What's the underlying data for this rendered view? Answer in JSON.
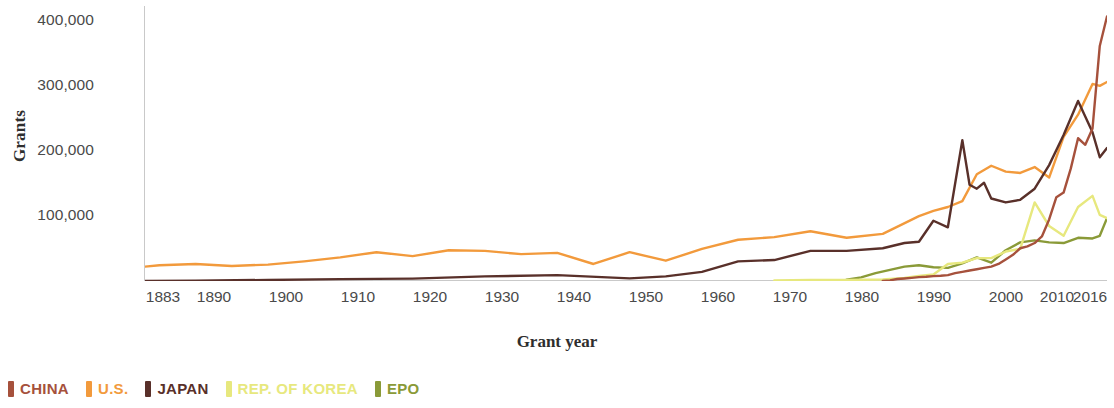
{
  "chart_data": {
    "type": "line",
    "title": "",
    "xlabel": "Grant year",
    "ylabel": "Grants",
    "xlim": [
      1883,
      2016
    ],
    "ylim": [
      0,
      420000
    ],
    "grid": false,
    "legend_position": "bottom-left",
    "ytick_labels": [
      "400,000",
      "300,000",
      "200,000",
      "100,000"
    ],
    "ytick_values": [
      400000,
      300000,
      200000,
      100000
    ],
    "xtick_labels": [
      "1883",
      "1890",
      "1900",
      "1910",
      "1920",
      "1930",
      "1940",
      "1950",
      "1960",
      "1970",
      "1980",
      "1990",
      "2000",
      "2010",
      "2016"
    ],
    "xtick_values": [
      1883,
      1890,
      1900,
      1910,
      1920,
      1930,
      1940,
      1950,
      1960,
      1970,
      1980,
      1990,
      2000,
      2010,
      2016
    ],
    "series": [
      {
        "name": "CHINA",
        "color": "#a6513c",
        "x": [
          1985,
          1986,
          1987,
          1988,
          1989,
          1990,
          1991,
          1992,
          1993,
          1994,
          1995,
          1996,
          1997,
          1998,
          1999,
          2000,
          2001,
          2002,
          2003,
          2004,
          2005,
          2006,
          2007,
          2008,
          2009,
          2010,
          2011,
          2012,
          2013,
          2014,
          2015,
          2016
        ],
        "values": [
          138,
          1020,
          3023,
          3900,
          4800,
          5900,
          6500,
          7500,
          8000,
          9000,
          12000,
          14000,
          16000,
          18000,
          20000,
          22000,
          26000,
          33000,
          40000,
          50000,
          53000,
          58000,
          68000,
          94000,
          128000,
          135000,
          172000,
          218000,
          208000,
          233000,
          359000,
          404000
        ]
      },
      {
        "name": "U.S.",
        "color": "#f29a3c",
        "x": [
          1883,
          1885,
          1890,
          1895,
          1900,
          1905,
          1910,
          1915,
          1920,
          1925,
          1930,
          1935,
          1940,
          1945,
          1950,
          1955,
          1960,
          1965,
          1970,
          1975,
          1980,
          1985,
          1990,
          1992,
          1994,
          1996,
          1998,
          2000,
          2002,
          2004,
          2006,
          2008,
          2010,
          2012,
          2014,
          2015,
          2016
        ],
        "values": [
          22000,
          24000,
          26000,
          23000,
          25000,
          30000,
          36000,
          44000,
          38000,
          47000,
          46000,
          41000,
          43000,
          26000,
          44000,
          31000,
          49000,
          63000,
          67000,
          76000,
          66000,
          72000,
          99000,
          107000,
          113000,
          122000,
          163000,
          176000,
          167000,
          165000,
          174000,
          158000,
          220000,
          254000,
          301000,
          298000,
          304000
        ]
      },
      {
        "name": "JAPAN",
        "color": "#59302a",
        "x": [
          1883,
          1890,
          1900,
          1910,
          1920,
          1930,
          1940,
          1950,
          1955,
          1960,
          1965,
          1970,
          1975,
          1980,
          1985,
          1988,
          1990,
          1992,
          1994,
          1996,
          1997,
          1998,
          1999,
          2000,
          2002,
          2004,
          2006,
          2008,
          2010,
          2012,
          2014,
          2015,
          2016
        ],
        "values": [
          99,
          600,
          1600,
          2800,
          3700,
          7000,
          9000,
          4000,
          7000,
          14000,
          30000,
          32000,
          46000,
          46000,
          50000,
          58000,
          60000,
          92000,
          82000,
          215000,
          147000,
          141000,
          150000,
          126000,
          120000,
          124000,
          141000,
          177000,
          223000,
          275000,
          227000,
          189000,
          203000
        ]
      },
      {
        "name": "REP. OF KOREA",
        "color": "#e7e87e",
        "x": [
          1970,
          1975,
          1980,
          1985,
          1988,
          1990,
          1992,
          1994,
          1996,
          1998,
          2000,
          2002,
          2004,
          2006,
          2008,
          2010,
          2012,
          2014,
          2015,
          2016
        ],
        "values": [
          1000,
          1500,
          1600,
          2300,
          4500,
          7800,
          10000,
          26000,
          28000,
          35000,
          35000,
          45000,
          49000,
          120000,
          84000,
          69000,
          113000,
          130000,
          101000,
          96000
        ]
      },
      {
        "name": "EPO",
        "color": "#8a9a38",
        "x": [
          1980,
          1982,
          1984,
          1986,
          1988,
          1990,
          1992,
          1994,
          1996,
          1998,
          2000,
          2002,
          2004,
          2006,
          2008,
          2010,
          2012,
          2014,
          2015,
          2016
        ],
        "values": [
          2000,
          5500,
          12000,
          17000,
          22000,
          24000,
          21000,
          20000,
          27000,
          36000,
          28000,
          47000,
          59000,
          62000,
          59000,
          58000,
          66000,
          65000,
          69000,
          96000
        ]
      }
    ]
  },
  "legend": {
    "items": [
      {
        "label": "CHINA",
        "color": "#a6513c"
      },
      {
        "label": "U.S.",
        "color": "#f29a3c"
      },
      {
        "label": "JAPAN",
        "color": "#59302a"
      },
      {
        "label": "REP. OF KOREA",
        "color": "#e7e87e"
      },
      {
        "label": "EPO",
        "color": "#8a9a38"
      }
    ]
  }
}
